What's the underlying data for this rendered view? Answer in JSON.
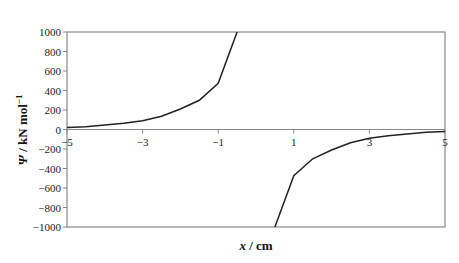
{
  "chart_data": {
    "type": "line",
    "title": "",
    "xlabel": "x / cm",
    "ylabel_symbol": "Ψ",
    "ylabel_unit": " / kN mol",
    "ylabel_sup": "−1",
    "xlim": [
      -5,
      5
    ],
    "ylim": [
      -1000,
      1000
    ],
    "xticks": [
      -5,
      -3,
      -1,
      1,
      3,
      5
    ],
    "xtick_labels": [
      "−5",
      "−3",
      "−1",
      "1",
      "3",
      "5"
    ],
    "yticks": [
      1000,
      800,
      600,
      400,
      200,
      0,
      -200,
      -400,
      -600,
      -800,
      -1000
    ],
    "ytick_labels": [
      "1000",
      "800",
      "600",
      "400",
      "200",
      "0",
      "−200",
      "−400",
      "−600",
      "−800",
      "−1000"
    ],
    "grid": false,
    "legend": null,
    "series": [
      {
        "name": "negative x branch",
        "x": [
          -5,
          -4.5,
          -4,
          -3.5,
          -3,
          -2.5,
          -2,
          -1.5,
          -1,
          -0.5
        ],
        "y": [
          20,
          28,
          45,
          65,
          90,
          135,
          210,
          300,
          475,
          1000
        ]
      },
      {
        "name": "positive x branch",
        "x": [
          0.5,
          1,
          1.5,
          2,
          2.5,
          3,
          3.5,
          4,
          4.5,
          5
        ],
        "y": [
          -1000,
          -475,
          -300,
          -210,
          -135,
          -90,
          -65,
          -45,
          -28,
          -20
        ]
      }
    ]
  }
}
